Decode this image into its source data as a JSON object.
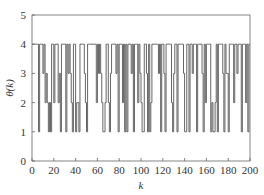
{
  "chart_data": {
    "type": "line",
    "subtype": "step",
    "title": "",
    "xlabel": "k",
    "ylabel": "θ(k)",
    "xlim": [
      0,
      200
    ],
    "ylim": [
      0,
      5
    ],
    "xticks": [
      0,
      20,
      40,
      60,
      80,
      100,
      120,
      140,
      160,
      180,
      200
    ],
    "yticks": [
      0,
      1,
      2,
      3,
      4,
      5
    ],
    "grid": false,
    "legend": null,
    "line_color": "#555555",
    "series": [
      {
        "name": "θ(k)",
        "x": [
          0,
          1,
          2,
          3,
          4,
          5,
          6,
          7,
          8,
          9,
          10,
          11,
          12,
          13,
          14,
          15,
          16,
          17,
          18,
          19,
          20,
          21,
          22,
          23,
          24,
          25,
          26,
          27,
          28,
          29,
          30,
          31,
          32,
          33,
          34,
          35,
          36,
          37,
          38,
          39,
          40,
          41,
          42,
          43,
          44,
          45,
          46,
          47,
          48,
          49,
          50,
          51,
          52,
          53,
          54,
          55,
          56,
          57,
          58,
          59,
          60,
          61,
          62,
          63,
          64,
          65,
          66,
          67,
          68,
          69,
          70,
          71,
          72,
          73,
          74,
          75,
          76,
          77,
          78,
          79,
          80,
          81,
          82,
          83,
          84,
          85,
          86,
          87,
          88,
          89,
          90,
          91,
          92,
          93,
          94,
          95,
          96,
          97,
          98,
          99,
          100,
          101,
          102,
          103,
          104,
          105,
          106,
          107,
          108,
          109,
          110,
          111,
          112,
          113,
          114,
          115,
          116,
          117,
          118,
          119,
          120,
          121,
          122,
          123,
          124,
          125,
          126,
          127,
          128,
          129,
          130,
          131,
          132,
          133,
          134,
          135,
          136,
          137,
          138,
          139,
          140,
          141,
          142,
          143,
          144,
          145,
          146,
          147,
          148,
          149,
          150,
          151,
          152,
          153,
          154,
          155,
          156,
          157,
          158,
          159,
          160,
          161,
          162,
          163,
          164,
          165,
          166,
          167,
          168,
          169,
          170,
          171,
          172,
          173,
          174,
          175,
          176,
          177,
          178,
          179,
          180,
          181,
          182,
          183,
          184,
          185,
          186,
          187,
          188,
          189,
          190,
          191,
          192,
          193,
          194,
          195,
          196,
          197,
          198,
          199,
          200
        ],
        "values": [
          4,
          4,
          4,
          4,
          4,
          4,
          1,
          4,
          4,
          4,
          3,
          4,
          2,
          3,
          2,
          1,
          2,
          1,
          4,
          4,
          2,
          4,
          4,
          4,
          2,
          3,
          1,
          4,
          4,
          4,
          4,
          1,
          4,
          3,
          4,
          3,
          2,
          1,
          4,
          4,
          1,
          2,
          2,
          1,
          4,
          4,
          4,
          4,
          3,
          2,
          1,
          4,
          4,
          4,
          4,
          4,
          4,
          4,
          4,
          2,
          4,
          3,
          4,
          3,
          2,
          1,
          1,
          2,
          4,
          4,
          2,
          1,
          3,
          4,
          4,
          4,
          4,
          3,
          4,
          1,
          4,
          4,
          4,
          2,
          4,
          1,
          4,
          1,
          4,
          4,
          4,
          3,
          4,
          1,
          4,
          4,
          4,
          2,
          4,
          3,
          2,
          1,
          1,
          4,
          4,
          3,
          1,
          4,
          1,
          2,
          4,
          4,
          4,
          4,
          4,
          4,
          3,
          4,
          1,
          4,
          4,
          3,
          1,
          4,
          4,
          4,
          4,
          4,
          2,
          1,
          3,
          4,
          4,
          1,
          4,
          4,
          4,
          4,
          4,
          3,
          1,
          1,
          4,
          4,
          1,
          4,
          4,
          3,
          4,
          4,
          4,
          1,
          4,
          4,
          4,
          4,
          3,
          1,
          4,
          2,
          4,
          4,
          4,
          4,
          1,
          2,
          1,
          1,
          2,
          4,
          1,
          4,
          4,
          4,
          4,
          3,
          1,
          4,
          3,
          3,
          1,
          4,
          4,
          4,
          4,
          2,
          4,
          4,
          3,
          4,
          4,
          4,
          1,
          4,
          4,
          4,
          2,
          4,
          1,
          4,
          4
        ]
      }
    ]
  }
}
